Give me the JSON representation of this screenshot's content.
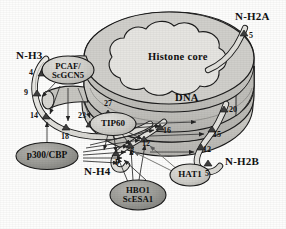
{
  "figure": {
    "structure_labels": {
      "histone_core": "Histone core",
      "dna": "DNA"
    },
    "colors": {
      "background": "#fdfdfc",
      "core_fill": "#e2e1dd",
      "disc_fill": "#c9c8c4",
      "dna_fill": "#cecdc8",
      "tail_fill": "#e8e7e3",
      "enzyme_dark": "#9a9a96",
      "enzyme_light": "#cfcec9",
      "outline": "#1c1c1c",
      "arrow": "#2a2a2a"
    }
  },
  "tails": [
    {
      "id": "h3",
      "name": "N-H3",
      "sites": [
        "4",
        "9",
        "14",
        "18",
        "23",
        "27"
      ]
    },
    {
      "id": "h4",
      "name": "N-H4",
      "sites": [
        "5",
        "8",
        "12",
        "16"
      ]
    },
    {
      "id": "h2a",
      "name": "N-H2A",
      "sites": [
        "5"
      ]
    },
    {
      "id": "h2b",
      "name": "N-H2B",
      "sites": [
        "5",
        "12",
        "15",
        "20"
      ]
    }
  ],
  "enzymes": [
    {
      "id": "pcaf",
      "line1": "PCAF/",
      "line2": "ScGCN5",
      "shade": "light"
    },
    {
      "id": "tip60",
      "line1": "TIP60",
      "line2": "",
      "shade": "light"
    },
    {
      "id": "p300",
      "line1": "p300/CBP",
      "line2": "",
      "shade": "dark"
    },
    {
      "id": "hbo1",
      "line1": "HBO1",
      "line2": "ScESA1",
      "shade": "dark"
    },
    {
      "id": "hat1",
      "line1": "HAT1",
      "line2": "",
      "shade": "light"
    }
  ]
}
